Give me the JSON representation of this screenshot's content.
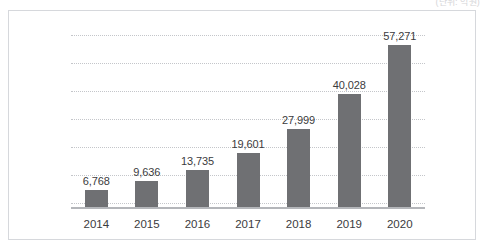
{
  "unit_caption": "(단위: 억원)",
  "chart_data": {
    "type": "bar",
    "title": "",
    "subtitle": "",
    "xlabel": "",
    "ylabel": "",
    "categories": [
      "2014",
      "2015",
      "2016",
      "2017",
      "2018",
      "2019",
      "2020"
    ],
    "values": [
      6768,
      9636,
      13735,
      19601,
      27999,
      40028,
      57271
    ],
    "value_labels": [
      "6,768",
      "9,636",
      "13,735",
      "19,601",
      "27,999",
      "40,028",
      "57,271"
    ],
    "series": [
      {
        "name": "",
        "values": [
          6768,
          9636,
          13735,
          19601,
          27999,
          40028,
          57271
        ]
      }
    ],
    "ylim": [
      0,
      62000
    ],
    "grid": true,
    "gridlines": 7,
    "legend": "none",
    "bar_color": "#6f7073",
    "gridline_color": "#c4c6ca",
    "axis_color": "#b4b6ba",
    "label_color": "#3b3b3d",
    "annotations": [
      "(단위: 억원)"
    ]
  }
}
